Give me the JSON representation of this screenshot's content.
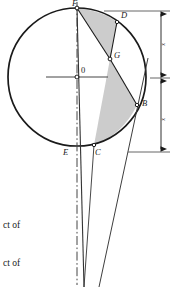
{
  "figure": {
    "kind": "geometry-diagram",
    "background_color": "#ffffff",
    "stroke_color": "#1a1a1a",
    "shade_color": "#c9c9c9",
    "thin_stroke_color": "#555555",
    "circle": {
      "center_label": "0",
      "center_x": 77,
      "center_y": 77,
      "radius": 69
    },
    "points": [
      {
        "id": "F",
        "label": "F",
        "x": 77,
        "y": 8,
        "label_x": 73,
        "label_y": 0
      },
      {
        "id": "D",
        "label": "D",
        "x": 117,
        "y": 22,
        "label_x": 121,
        "label_y": 13
      },
      {
        "id": "G",
        "label": "G",
        "x": 110,
        "y": 59,
        "label_x": 114,
        "label_y": 52
      },
      {
        "id": "B",
        "label": "B",
        "x": 137,
        "y": 105,
        "label_x": 142,
        "label_y": 100
      },
      {
        "id": "C",
        "label": "C",
        "x": 94,
        "y": 145,
        "label_x": 95,
        "label_y": 148
      },
      {
        "id": "E",
        "label": "E",
        "x": 70,
        "y": 146,
        "label_x": 64,
        "label_y": 148
      }
    ],
    "dimensions": {
      "upper_label": "x",
      "lower_label": "x",
      "upper_label_x": 163,
      "upper_label_y": 42,
      "lower_label_x": 163,
      "lower_label_y": 118,
      "line_x": 161,
      "top_y": 11,
      "mid_y": 78,
      "bottom_y": 152
    },
    "caption": {
      "line1": "ct of",
      "line2": "ct of"
    }
  }
}
